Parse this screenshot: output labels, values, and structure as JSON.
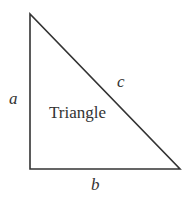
{
  "diagram": {
    "title": "Triangle",
    "stroke_color": "#333333",
    "vertices": [
      [
        30,
        14
      ],
      [
        30,
        169
      ],
      [
        180,
        169
      ]
    ],
    "labels": {
      "a": "a",
      "b": "b",
      "c": "c",
      "center": "Triangle"
    }
  }
}
